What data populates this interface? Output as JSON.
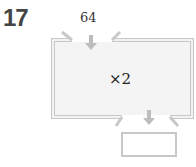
{
  "problem": {
    "number": "17",
    "input_value": "64",
    "operation": "×2",
    "output_value": ""
  },
  "colors": {
    "box_fill": "#f4f4f4",
    "box_border": "#c8c8c8",
    "arrow": "#bdbdbd"
  }
}
